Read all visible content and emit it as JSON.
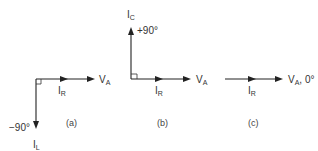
{
  "colors": {
    "ink": "#222222",
    "background": "#ffffff"
  },
  "panels": [
    {
      "caption": "(a)",
      "vectors": [
        {
          "name": "V",
          "sub": "A",
          "direction": "0°",
          "label_suffix": ""
        },
        {
          "name": "I",
          "sub": "R",
          "direction": "0°"
        },
        {
          "name": "I",
          "sub": "L",
          "direction": "-90°",
          "angle_label": "−90°"
        }
      ]
    },
    {
      "caption": "(b)",
      "vectors": [
        {
          "name": "V",
          "sub": "A",
          "direction": "0°",
          "label_suffix": ""
        },
        {
          "name": "I",
          "sub": "R",
          "direction": "0°"
        },
        {
          "name": "I",
          "sub": "C",
          "direction": "+90°",
          "angle_label": "+90°"
        }
      ]
    },
    {
      "caption": "(c)",
      "vectors": [
        {
          "name": "V",
          "sub": "A",
          "direction": "0°",
          "label_suffix": ", 0°"
        },
        {
          "name": "I",
          "sub": "R",
          "direction": "0°"
        }
      ]
    }
  ]
}
